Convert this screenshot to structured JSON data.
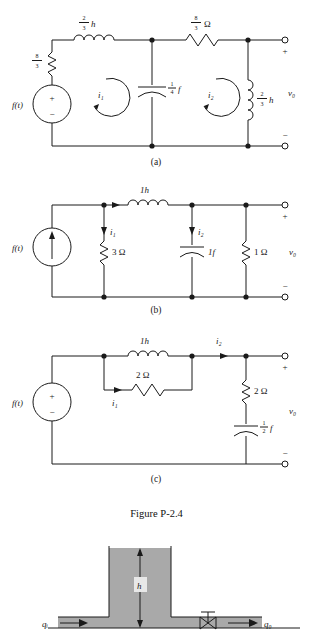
{
  "figure": {
    "caption": "Figure P-2.4",
    "sub_labels": {
      "a": "(a)",
      "b": "(b)",
      "c": "(c)"
    }
  },
  "circuit_a": {
    "source_label": "f(t)",
    "source_plus": "+",
    "source_minus": "−",
    "resistor_left": {
      "num": "8",
      "den": "3"
    },
    "inductor_top": {
      "num": "2",
      "den": "3",
      "unit": "h"
    },
    "resistor_top": {
      "num": "8",
      "den": "3",
      "unit": "Ω"
    },
    "capacitor": {
      "num": "1",
      "den": "4",
      "unit": "f"
    },
    "inductor_right": {
      "num": "2",
      "den": "3",
      "unit": "h"
    },
    "mesh_1": "i₁",
    "mesh_2": "i₂",
    "output_label": "v₀",
    "terminal_plus": "+",
    "terminal_minus": "−"
  },
  "circuit_b": {
    "source_label": "f(t)",
    "source_type": "current-source",
    "inductor_top": "1h",
    "resistor_left": "3 Ω",
    "capacitor": "1f",
    "resistor_right": "1 Ω",
    "current_1": "i₁",
    "current_2": "i₂",
    "output_label": "v₀",
    "terminal_plus": "+",
    "terminal_minus": "−"
  },
  "circuit_c": {
    "source_label": "f(t)",
    "source_plus": "+",
    "source_minus": "−",
    "inductor": "1h",
    "resistor_parallel": "2 Ω",
    "resistor_series": "2 Ω",
    "capacitor": {
      "num": "1",
      "den": "2",
      "unit": "f"
    },
    "current_1": "i₁",
    "current_2": "i₂",
    "output_label": "v₀",
    "terminal_plus": "+",
    "terminal_minus": "−"
  },
  "tank_diagram": {
    "inflow_label": "qᵢ",
    "height_label": "h",
    "outflow_label": "q₀",
    "fill_color": "#a9a9a9"
  }
}
